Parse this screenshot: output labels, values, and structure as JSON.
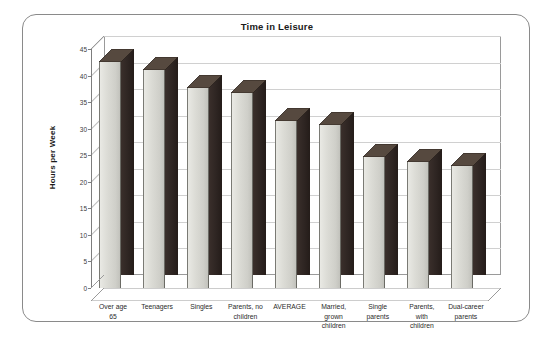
{
  "frame": {
    "name": "chart-card"
  },
  "chart_data": {
    "type": "bar",
    "title": "Time in Leisure",
    "xlabel": "",
    "ylabel": "Hours per Week",
    "ylim": [
      0,
      45
    ],
    "ytick_step": 5,
    "grid": true,
    "legend": "none",
    "style": "3d-column",
    "categories": [
      "Over age 65",
      "Teenagers",
      "Singles",
      "Parents, no children",
      "AVERAGE",
      "Married, grown children",
      "Single parents",
      "Parents, with children",
      "Dual-career parents"
    ],
    "category_lines": [
      [
        "Over age",
        "65"
      ],
      [
        "Teenagers"
      ],
      [
        "Singles"
      ],
      [
        "Parents, no",
        "children"
      ],
      [
        "AVERAGE"
      ],
      [
        "Married,",
        "grown",
        "children"
      ],
      [
        "Single",
        "parents"
      ],
      [
        "Parents,",
        "with",
        "children"
      ],
      [
        "Dual-career",
        "parents"
      ]
    ],
    "values": [
      42.5,
      41.0,
      37.6,
      36.8,
      31.5,
      30.7,
      24.6,
      23.7,
      23.0
    ],
    "ytick_labels": [
      "45",
      "40",
      "35",
      "30",
      "25",
      "20",
      "15",
      "10",
      "5",
      "0"
    ],
    "ytick_values": [
      45,
      40,
      35,
      30,
      25,
      20,
      15,
      10,
      5,
      0
    ],
    "colors": {
      "bar_front": "#dcdcd6",
      "bar_side": "#2e2522",
      "bar_top": "#54483f",
      "gridline": "#d0d0d0",
      "axis": "#7d7d7d",
      "frame_border": "#8a8a8a",
      "text": "#1a1a1a",
      "background": "#ffffff"
    }
  }
}
